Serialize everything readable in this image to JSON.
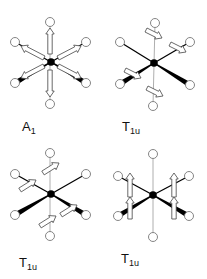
{
  "colors": {
    "bond_dark": "#000000",
    "bond_light": "#999999",
    "atom_fill": "#ffffff",
    "atom_stroke": "#777777",
    "arrow_fill": "#ffffff",
    "arrow_stroke": "#444444"
  },
  "panels": [
    {
      "id": "a1",
      "label": {
        "main": "A",
        "sub": "1",
        "x": 22,
        "y": 120
      },
      "center": [
        51,
        62
      ],
      "atoms": {
        "top": [
          50,
          22
        ],
        "bottom": [
          50,
          104
        ],
        "ul": [
          15,
          42
        ],
        "ur": [
          86,
          42
        ],
        "ll": [
          15,
          83
        ],
        "lr": [
          86,
          83
        ]
      },
      "arrows": [
        {
          "from": [
            50,
            54
          ],
          "to": [
            50,
            28
          ]
        },
        {
          "from": [
            50,
            70
          ],
          "to": [
            50,
            97
          ]
        },
        {
          "from": [
            44,
            58
          ],
          "to": [
            21,
            46
          ]
        },
        {
          "from": [
            58,
            58
          ],
          "to": [
            81,
            46
          ]
        },
        {
          "from": [
            44,
            66
          ],
          "to": [
            21,
            78
          ]
        },
        {
          "from": [
            58,
            66
          ],
          "to": [
            81,
            78
          ]
        }
      ]
    },
    {
      "id": "t1u-a",
      "label": {
        "main": "T",
        "sub": "1u",
        "x": 122,
        "y": 120
      },
      "center": [
        154,
        63
      ],
      "atoms": {
        "top": [
          155,
          23
        ],
        "bottom": [
          153,
          106
        ],
        "ul": [
          120,
          42
        ],
        "ur": [
          190,
          42
        ],
        "ll": [
          120,
          84
        ],
        "lr": [
          190,
          85
        ]
      },
      "arrows": [
        {
          "from": [
            146,
            30
          ],
          "to": [
            162,
            38
          ]
        },
        {
          "from": [
            170,
            44
          ],
          "to": [
            186,
            52
          ]
        },
        {
          "from": [
            125,
            70
          ],
          "to": [
            141,
            78
          ]
        },
        {
          "from": [
            147,
            88
          ],
          "to": [
            163,
            96
          ]
        }
      ]
    },
    {
      "id": "t1u-b",
      "label": {
        "main": "T",
        "sub": "1u",
        "x": 19,
        "y": 256
      },
      "center": [
        51,
        194
      ],
      "atoms": {
        "top": [
          50,
          153
        ],
        "bottom": [
          50,
          236
        ],
        "ul": [
          15,
          174
        ],
        "ur": [
          86,
          174
        ],
        "ll": [
          15,
          215
        ],
        "lr": [
          86,
          215
        ]
      },
      "arrows": [
        {
          "from": [
            43,
            173
          ],
          "to": [
            59,
            163
          ]
        },
        {
          "from": [
            20,
            190
          ],
          "to": [
            36,
            180
          ]
        },
        {
          "from": [
            61,
            215
          ],
          "to": [
            77,
            205
          ]
        },
        {
          "from": [
            40,
            226
          ],
          "to": [
            56,
            216
          ]
        }
      ]
    },
    {
      "id": "t1u-c",
      "label": {
        "main": "T",
        "sub": "1u",
        "x": 121,
        "y": 252
      },
      "center": [
        153,
        195
      ],
      "atoms": {
        "top": [
          153,
          154
        ],
        "bottom": [
          153,
          237
        ],
        "ul": [
          118,
          176
        ],
        "ur": [
          189,
          176
        ],
        "ll": [
          118,
          216
        ],
        "lr": [
          189,
          216
        ]
      },
      "arrows": [
        {
          "from": [
            130,
            197
          ],
          "to": [
            130,
            173
          ]
        },
        {
          "from": [
            174,
            197
          ],
          "to": [
            174,
            173
          ]
        },
        {
          "from": [
            130,
            219
          ],
          "to": [
            130,
            197
          ]
        },
        {
          "from": [
            174,
            219
          ],
          "to": [
            174,
            197
          ]
        }
      ]
    }
  ]
}
